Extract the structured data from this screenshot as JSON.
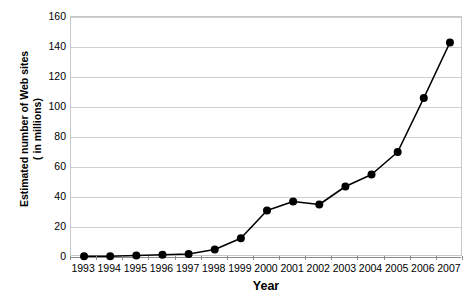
{
  "chart_data": {
    "type": "line",
    "title": "",
    "subtitle": "",
    "xlabel": "Year",
    "ylabel": "Estimated number of Web sites ( in millions)",
    "ylabel_line1": "Estimated number of Web sites",
    "ylabel_line2": "( in millions)",
    "categories": [
      "1993",
      "1994",
      "1995",
      "1996",
      "1997",
      "1998",
      "1999",
      "2000",
      "2001",
      "2002",
      "2003",
      "2004",
      "2005",
      "2006",
      "2007"
    ],
    "values": [
      0.5,
      0.5,
      1,
      1.5,
      2,
      5,
      12.5,
      31,
      37,
      35,
      47,
      55,
      70,
      106,
      143
    ],
    "series": [
      {
        "name": "Estimated number of Web sites",
        "values": [
          0.5,
          0.5,
          1,
          1.5,
          2,
          5,
          12.5,
          31,
          37,
          35,
          47,
          55,
          70,
          106,
          143
        ]
      }
    ],
    "ylim": [
      0,
      160
    ],
    "yticks": [
      0,
      20,
      40,
      60,
      80,
      100,
      120,
      140,
      160
    ],
    "ytick_labels": [
      "0",
      "20",
      "40",
      "60",
      "80",
      "100",
      "120",
      "140",
      "160"
    ],
    "grid": true,
    "grid_axis": "y",
    "legend": false,
    "legend_position": "none",
    "marker": "filled-circle",
    "line_color": "#000000",
    "marker_color": "#000000",
    "grid_color": "#cfcfcf",
    "axis_color": "#8a8a8a",
    "plot_background": "#ffffff"
  }
}
